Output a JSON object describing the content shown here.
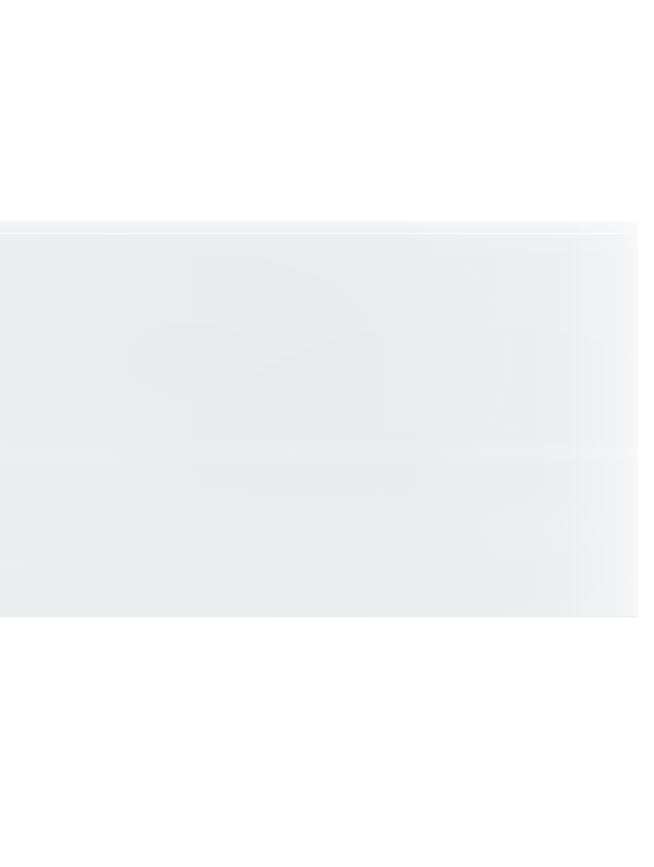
{
  "document": {
    "title": "Blank scanned page",
    "page_background": "#ffffff",
    "canvas": {
      "width": 654,
      "height": 867
    },
    "text_content": "",
    "has_visible_text": false,
    "notes": ""
  },
  "scan_region": {
    "label": "",
    "fill_color": "#ecedee",
    "edge_color": "#e4e7e8",
    "x": 0,
    "y": 220,
    "width": 640,
    "height": 398
  },
  "margins": {
    "top": {
      "label": "",
      "height": 220,
      "color": "#ffffff"
    },
    "bottom": {
      "label": "",
      "height": 249,
      "color": "#ffffff"
    },
    "right": {
      "label": "",
      "width": 16,
      "color": "#ffffff"
    }
  },
  "artifacts": {
    "top_edge_highlight": "",
    "upper_scan_line": "",
    "mid_band_highlight": "",
    "bottom_edge": ""
  }
}
